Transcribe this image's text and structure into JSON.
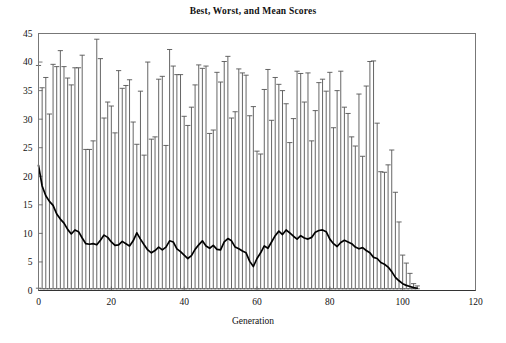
{
  "chart_data": {
    "type": "bar",
    "title": "Best, Worst, and Mean Scores",
    "subtitle": "",
    "xlabel": "Generation",
    "ylabel": "",
    "xlim": [
      0,
      120
    ],
    "ylim": [
      0,
      45
    ],
    "xticks": [
      0,
      20,
      40,
      60,
      80,
      100,
      120
    ],
    "yticks": [
      0,
      5,
      10,
      15,
      20,
      25,
      30,
      35,
      40,
      45
    ],
    "grid": false,
    "legend": null,
    "series": [
      {
        "name": "Worst",
        "role": "errorbar-top",
        "values": [
          39.4,
          35.5,
          37.3,
          30.9,
          39.6,
          39.2,
          42.0,
          39.2,
          37.2,
          36.0,
          39.0,
          39.0,
          41.2,
          24.7,
          24.7,
          26.2,
          44.0,
          40.6,
          30.2,
          33.0,
          32.3,
          27.6,
          38.5,
          35.4,
          35.9,
          36.9,
          29.5,
          25.6,
          34.9,
          23.7,
          40.0,
          26.5,
          26.9,
          37.0,
          37.5,
          25.4,
          42.2,
          39.3,
          37.8,
          37.8,
          30.5,
          28.9,
          32.1,
          36.0,
          39.5,
          38.9,
          39.3,
          27.5,
          28.1,
          38.2,
          36.5,
          40.1,
          41.0,
          30.2,
          31.3,
          38.8,
          38.1,
          37.7,
          30.6,
          32.2,
          24.4,
          23.9,
          35.2,
          38.7,
          29.8,
          37.3,
          36.1,
          35.0,
          32.7,
          25.9,
          30.1,
          38.4,
          38.0,
          33.0,
          38.1,
          26.2,
          31.5,
          36.4,
          37.0,
          34.9,
          38.2,
          28.5,
          35.0,
          38.4,
          32.1,
          31.0,
          26.9,
          25.3,
          34.4,
          23.5,
          35.8,
          40.1,
          40.2,
          29.3,
          20.8,
          20.7,
          22.0,
          24.6,
          17.2,
          12.0,
          6.2,
          4.8,
          3.0,
          1.2,
          0.8
        ],
        "color": "#555555"
      },
      {
        "name": "Best",
        "role": "errorbar-bottom",
        "values": [
          0.4,
          0.3,
          0.3,
          0.3,
          0.3,
          0.3,
          0.3,
          0.3,
          0.3,
          0.3,
          0.3,
          0.3,
          0.3,
          0.3,
          0.3,
          0.3,
          0.3,
          0.3,
          0.3,
          0.3,
          0.3,
          0.3,
          0.3,
          0.3,
          0.3,
          0.3,
          0.3,
          0.3,
          0.3,
          0.3,
          0.3,
          0.3,
          0.3,
          0.3,
          0.3,
          0.3,
          0.3,
          0.3,
          0.3,
          0.3,
          0.3,
          0.3,
          0.3,
          0.3,
          0.3,
          0.3,
          0.3,
          0.3,
          0.3,
          0.3,
          0.3,
          0.3,
          0.3,
          0.3,
          0.3,
          0.3,
          0.3,
          0.3,
          0.3,
          0.3,
          0.3,
          0.3,
          0.3,
          0.3,
          0.3,
          0.3,
          0.3,
          0.3,
          0.3,
          0.3,
          0.3,
          0.3,
          0.3,
          0.3,
          0.3,
          0.3,
          0.3,
          0.3,
          0.3,
          0.3,
          0.3,
          0.3,
          0.3,
          0.3,
          0.3,
          0.3,
          0.3,
          0.3,
          0.3,
          0.3,
          0.3,
          0.3,
          0.3,
          0.3,
          0.3,
          0.3,
          0.3,
          0.3,
          0.3,
          0.3,
          0.3,
          0.3,
          0.3,
          0.3,
          0.3
        ],
        "color": "#555555"
      },
      {
        "name": "Mean",
        "role": "line",
        "values": [
          21.9,
          18.3,
          16.6,
          15.6,
          14.9,
          13.4,
          12.5,
          11.8,
          10.7,
          9.9,
          10.6,
          10.3,
          9.2,
          8.2,
          8.1,
          8.2,
          8.0,
          8.8,
          9.7,
          9.3,
          8.5,
          7.9,
          8.0,
          8.6,
          8.2,
          7.8,
          8.7,
          10.1,
          9.0,
          8.0,
          7.1,
          6.6,
          7.0,
          7.6,
          7.1,
          7.6,
          8.7,
          8.5,
          7.3,
          6.8,
          6.2,
          5.6,
          6.1,
          7.2,
          8.0,
          8.7,
          7.8,
          7.4,
          7.9,
          7.2,
          7.1,
          8.5,
          9.1,
          8.7,
          7.6,
          7.3,
          6.9,
          6.6,
          5.1,
          4.2,
          5.6,
          6.6,
          7.8,
          7.4,
          8.5,
          9.6,
          10.4,
          9.8,
          10.6,
          10.1,
          9.5,
          9.0,
          9.6,
          9.2,
          9.0,
          9.3,
          10.2,
          10.5,
          10.6,
          10.3,
          9.0,
          8.2,
          7.7,
          8.4,
          8.8,
          8.5,
          8.2,
          7.6,
          7.3,
          7.5,
          7.0,
          6.6,
          5.8,
          5.6,
          4.9,
          4.6,
          4.1,
          3.3,
          2.3,
          1.7,
          1.2,
          0.9,
          0.7,
          0.5,
          0.4
        ],
        "color": "#000000"
      }
    ],
    "x": [
      0,
      1,
      2,
      3,
      4,
      5,
      6,
      7,
      8,
      9,
      10,
      11,
      12,
      13,
      14,
      15,
      16,
      17,
      18,
      19,
      20,
      21,
      22,
      23,
      24,
      25,
      26,
      27,
      28,
      29,
      30,
      31,
      32,
      33,
      34,
      35,
      36,
      37,
      38,
      39,
      40,
      41,
      42,
      43,
      44,
      45,
      46,
      47,
      48,
      49,
      50,
      51,
      52,
      53,
      54,
      55,
      56,
      57,
      58,
      59,
      60,
      61,
      62,
      63,
      64,
      65,
      66,
      67,
      68,
      69,
      70,
      71,
      72,
      73,
      74,
      75,
      76,
      77,
      78,
      79,
      80,
      81,
      82,
      83,
      84,
      85,
      86,
      87,
      88,
      89,
      90,
      91,
      92,
      93,
      94,
      95,
      96,
      97,
      98,
      99,
      100,
      101,
      102,
      103,
      104
    ]
  },
  "axes": {
    "x_tick_labels": [
      "0",
      "20",
      "40",
      "60",
      "80",
      "100",
      "120"
    ],
    "y_tick_labels": [
      "0",
      "5",
      "10",
      "15",
      "20",
      "25",
      "30",
      "35",
      "40",
      "45"
    ]
  },
  "style": {
    "frame_color": "#777777",
    "bar_color": "#555555",
    "mean_line_color": "#000000",
    "background": "#ffffff"
  }
}
